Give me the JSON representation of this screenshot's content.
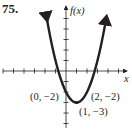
{
  "problem_number": "75.",
  "chart_data": {
    "type": "line",
    "title": "",
    "function": "f(x) = x^2 - 2x - 2",
    "xlabel": "x",
    "ylabel": "f(x)",
    "xlim": [
      -6,
      6
    ],
    "ylim": [
      -5,
      5
    ],
    "grid": false,
    "tick_spacing": 1,
    "x": [
      -1.8,
      -1,
      0,
      1,
      2,
      3,
      3.8
    ],
    "series": [
      {
        "name": "f(x)",
        "values": [
          4.84,
          1,
          -2,
          -3,
          -2,
          1,
          4.84
        ]
      }
    ],
    "annotations": [
      {
        "label": "(0, −2)",
        "x": 0,
        "y": -2
      },
      {
        "label": "(2, −2)",
        "x": 2,
        "y": -2
      },
      {
        "label": "(1, −3)",
        "x": 1,
        "y": -3
      }
    ],
    "arrows_on_curve_ends": true,
    "arrows_on_axes": true
  },
  "labels": {
    "x_axis": "x",
    "y_axis": "f(x)",
    "point_a": "(0, −2)",
    "point_b": "(2, −2)",
    "vertex": "(1, −3)"
  }
}
